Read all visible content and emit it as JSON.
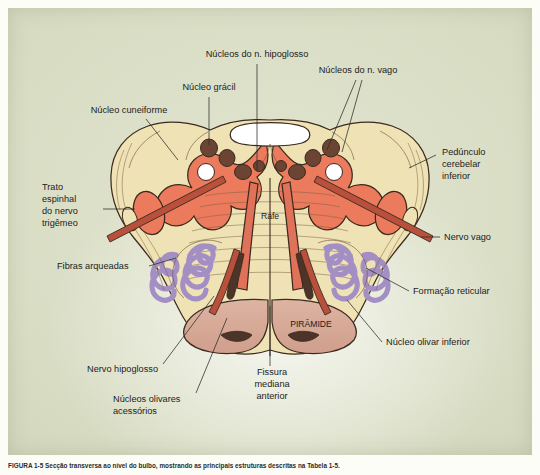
{
  "figure": {
    "caption_number": "FIGURA 1-5",
    "caption_text": "Secção transversa ao nível do bulbo, mostrando as principais estruturas descritas na Tabela 1-5.",
    "background_color": "#d9ddc4",
    "language": "pt-BR"
  },
  "colors": {
    "plate_bg": "#d9ddc4",
    "tegmentum_salmon": "#ec7a5c",
    "white_matter_cream": "#efe2b4",
    "nucleus_brown": "#6b4434",
    "olive_purple": "#a48fc4",
    "pyramid_pink": "#d9ab9a",
    "tract_red": "#b8503c",
    "outline": "#3b2a20",
    "label_text": "#1c1c1c"
  },
  "inner_labels": [
    {
      "id": "rafe",
      "text": "Rafe",
      "x": 270,
      "y": 219
    },
    {
      "id": "piramide",
      "text": "PIRÂMIDE",
      "x": 311,
      "y": 327
    }
  ],
  "callouts": [
    {
      "id": "nucleos-hipoglosso",
      "text": "Núcleos do n. hipoglosso",
      "anchor": "top",
      "text_x": 257,
      "text_y": 57,
      "align": "middle"
    },
    {
      "id": "nucleo-gracil",
      "text": "Núcleo grácil",
      "anchor": "top-left",
      "text_x": 209,
      "text_y": 90,
      "align": "middle"
    },
    {
      "id": "nucleos-vago",
      "text": "Núcleos do n. vago",
      "anchor": "top-right",
      "text_x": 358,
      "text_y": 73,
      "align": "middle"
    },
    {
      "id": "nucleo-cuneiforme",
      "text": "Núcleo cuneiforme",
      "anchor": "left-top",
      "text_x": 129,
      "text_y": 113,
      "align": "middle"
    },
    {
      "id": "pedunculo-cerebelar-inferior",
      "text": "Pedúnculo cerebelar inferior",
      "lines": [
        "Pedúnculo",
        "cerebelar",
        "inferior"
      ],
      "anchor": "right",
      "text_x": 442,
      "text_y": 160,
      "align": "start"
    },
    {
      "id": "trato-espinhal-trigemeo",
      "text": "Trato espinhal do nervo trigêmeo",
      "lines": [
        "Trato",
        "espinhal",
        "do nervo",
        "trigêmeo"
      ],
      "anchor": "left",
      "text_x": 42,
      "text_y": 190,
      "align": "start"
    },
    {
      "id": "nervo-vago",
      "text": "Nervo vago",
      "anchor": "right",
      "text_x": 444,
      "text_y": 240,
      "align": "start"
    },
    {
      "id": "fibras-arqueadas",
      "text": "Fibras arqueadas",
      "anchor": "left",
      "text_x": 57,
      "text_y": 269,
      "align": "start"
    },
    {
      "id": "formacao-reticular",
      "text": "Formação reticular",
      "anchor": "right",
      "text_x": 413,
      "text_y": 294,
      "align": "start"
    },
    {
      "id": "nucleo-olivar-inferior",
      "text": "Núcleo olivar inferior",
      "anchor": "right",
      "text_x": 386,
      "text_y": 345,
      "align": "start"
    },
    {
      "id": "nervo-hipoglosso",
      "text": "Nervo hipoglosso",
      "anchor": "bottom-left",
      "text_x": 87,
      "text_y": 372,
      "align": "start"
    },
    {
      "id": "fissura-mediana-anterior",
      "text": "Fissura mediana anterior",
      "lines": [
        "Fissura",
        "mediana",
        "anterior"
      ],
      "anchor": "bottom",
      "text_x": 272,
      "text_y": 375,
      "align": "middle"
    },
    {
      "id": "nucleos-olivares-acessorios",
      "text": "Núcleos olivares acessórios",
      "lines": [
        "Núcleos olivares",
        "acessórios"
      ],
      "anchor": "bottom-left",
      "text_x": 113,
      "text_y": 402,
      "align": "start"
    }
  ]
}
